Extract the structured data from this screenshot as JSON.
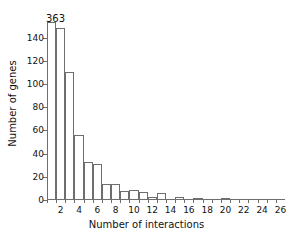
{
  "chart_data": {
    "type": "bar",
    "title": "",
    "xlabel": "Number of interactions",
    "ylabel": "Number of genes",
    "categories": [
      1,
      2,
      3,
      4,
      5,
      6,
      7,
      8,
      9,
      10,
      11,
      12,
      13,
      14,
      15,
      16,
      17,
      18,
      19,
      20,
      21,
      22,
      23,
      24,
      25,
      26
    ],
    "values": [
      363,
      148,
      110,
      56,
      33,
      31,
      14,
      14,
      8,
      9,
      7,
      3,
      6,
      0,
      3,
      1,
      2,
      1,
      1,
      2,
      0,
      0,
      0,
      0,
      1,
      1
    ],
    "xlim": [
      0.5,
      26.5
    ],
    "ylim": [
      0,
      150
    ],
    "ytick_labels": [
      "0",
      "20",
      "40",
      "60",
      "80",
      "100",
      "120",
      "140"
    ],
    "ytick_values": [
      0,
      20,
      40,
      60,
      80,
      100,
      120,
      140
    ],
    "xtick_labels": [
      "2",
      "4",
      "6",
      "8",
      "10",
      "12",
      "14",
      "16",
      "18",
      "20",
      "22",
      "24",
      "26"
    ],
    "xtick_values": [
      2,
      4,
      6,
      8,
      10,
      12,
      14,
      16,
      18,
      20,
      22,
      24,
      26
    ],
    "grid": false,
    "legend": false,
    "annotations": [
      {
        "text": "363",
        "x": 1,
        "y": 363,
        "note": "first bar clipped by y-axis top"
      }
    ],
    "bar_fill_color": "#ffffff",
    "bar_edge_color": "#6e6e6e",
    "axis_color": "#6e6e6e",
    "text_color": "#111111",
    "background_color": "#ffffff"
  }
}
